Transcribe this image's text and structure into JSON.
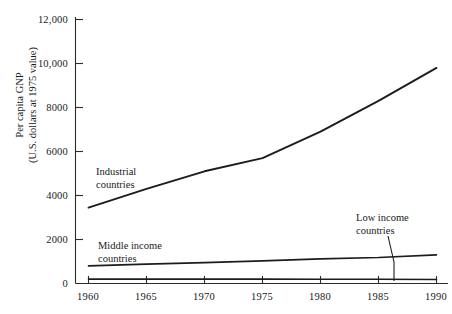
{
  "chart_data": {
    "type": "line",
    "title": "",
    "subtitle": "",
    "xlabel": "",
    "ylabel": "Per capita GNP",
    "ylabel_line2": "(U.S. dollars at 1975 value)",
    "x": [
      1960,
      1965,
      1970,
      1975,
      1980,
      1985,
      1990
    ],
    "xtick_labels": [
      "1960",
      "1965",
      "1970",
      "1975",
      "1980",
      "1985",
      "1990"
    ],
    "ytick_labels": [
      "0",
      "2000",
      "4000",
      "6000",
      "8000",
      "10,000",
      "12,000"
    ],
    "ytick_values": [
      0,
      2000,
      4000,
      6000,
      8000,
      10000,
      12000
    ],
    "xlim": [
      1960,
      1990
    ],
    "ylim": [
      0,
      12000
    ],
    "grid": false,
    "legend_position": "inline-annotations",
    "series": [
      {
        "name": "Industrial countries",
        "values": [
          3450,
          4300,
          5100,
          5700,
          6900,
          8300,
          9800
        ],
        "annotation": "Industrial\ncountries",
        "color": "#1c1c1c"
      },
      {
        "name": "Middle income countries",
        "values": [
          800,
          880,
          950,
          1030,
          1120,
          1180,
          1300
        ],
        "annotation": "Middle income\ncountries",
        "color": "#1c1c1c"
      },
      {
        "name": "Low income countries",
        "values": [
          200,
          200,
          200,
          200,
          190,
          190,
          180
        ],
        "annotation": "Low income\ncountries",
        "color": "#1c1c1c"
      }
    ],
    "annotations": [
      {
        "name": "industrial-countries-label",
        "line1": "Industrial",
        "line2": "countries"
      },
      {
        "name": "middle-income-countries-label",
        "line1": "Middle income",
        "line2": "countries"
      },
      {
        "name": "low-income-countries-label",
        "line1": "Low income",
        "line2": "countries",
        "leader": true
      }
    ]
  },
  "axis": {
    "y_title_line1": "Per capita GNP",
    "y_title_line2": "(U.S. dollars at 1975 value)",
    "y_ticks": [
      {
        "label": "12,000"
      },
      {
        "label": "10,000"
      },
      {
        "label": "8000"
      },
      {
        "label": "6000"
      },
      {
        "label": "4000"
      },
      {
        "label": "2000"
      },
      {
        "label": "0"
      }
    ],
    "x_ticks": [
      {
        "label": "1960"
      },
      {
        "label": "1965"
      },
      {
        "label": "1970"
      },
      {
        "label": "1975"
      },
      {
        "label": "1980"
      },
      {
        "label": "1985"
      },
      {
        "label": "1990"
      }
    ]
  },
  "colors": {
    "background": "#ffffff",
    "ink": "#1c1c1c",
    "axis": "#2b2b2b"
  }
}
